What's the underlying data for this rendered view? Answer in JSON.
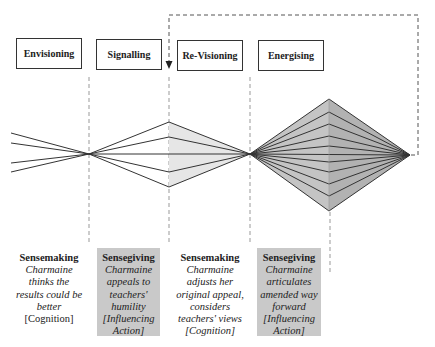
{
  "phases": [
    {
      "label": "Envisioning"
    },
    {
      "label": "Signalling"
    },
    {
      "label": "Re-Visioning"
    },
    {
      "label": "Energising"
    }
  ],
  "captions": [
    {
      "title": "Sensemaking",
      "lines": [
        "Charmaine",
        "thinks the",
        "results could be",
        "better",
        "[Cognition]"
      ],
      "shaded": false
    },
    {
      "title": "Sensegiving",
      "lines": [
        "Charmaine",
        "appeals to",
        "teachers'",
        "humility",
        "[Influencing",
        "Action]"
      ],
      "shaded": true
    },
    {
      "title": "Sensemaking",
      "lines": [
        "Charmaine",
        "adjusts her",
        "original appeal,",
        "considers",
        "teachers' views",
        "[Cognition]"
      ],
      "shaded": false
    },
    {
      "title": "Sensegiving",
      "lines": [
        "Charmaine",
        "articulates",
        "amended way",
        "forward",
        "[Influencing",
        "Action]"
      ],
      "shaded": true
    }
  ],
  "colors": {
    "line": "#333333",
    "dash": "#888888",
    "light_fill": "#e6e6e6",
    "diamond_left": "#c4c4c4",
    "diamond_right": "#b2b2b2",
    "caption_shade": "#c9c9c9"
  },
  "icons": {
    "feedback_arrow": "arrow-down-icon"
  }
}
